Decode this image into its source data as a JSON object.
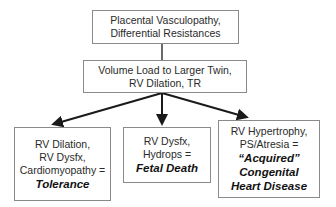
{
  "diagram": {
    "type": "flowchart",
    "nodes": {
      "top": {
        "lines": [
          "Placental Vasculopathy,",
          "Differential Resistances"
        ]
      },
      "middle": {
        "lines": [
          "Volume Load to Larger Twin,",
          "RV Dilation, TR"
        ]
      },
      "left": {
        "lines": [
          "RV Dilation,",
          "RV Dysfx,",
          "Cardiomyopathy ="
        ],
        "outcome": "Tolerance"
      },
      "center": {
        "lines": [
          "RV Dysfx,",
          "Hydrops ="
        ],
        "outcome": "Fetal Death"
      },
      "right": {
        "lines": [
          "RV Hypertrophy,",
          "PS/Atresia ="
        ],
        "outcome_lines": [
          "“Acquired”",
          "Congenital",
          "Heart Disease"
        ]
      }
    },
    "edges": [
      {
        "from": "top",
        "to": "middle",
        "style": "line"
      },
      {
        "from": "middle",
        "to": "left",
        "style": "arrow"
      },
      {
        "from": "middle",
        "to": "center",
        "style": "arrow"
      },
      {
        "from": "middle",
        "to": "right",
        "style": "arrow"
      }
    ],
    "colors": {
      "box_border": "#8a8a8a",
      "arrow": "#1a1a1a",
      "text": "#2a2a2a",
      "background": "#ffffff"
    }
  }
}
